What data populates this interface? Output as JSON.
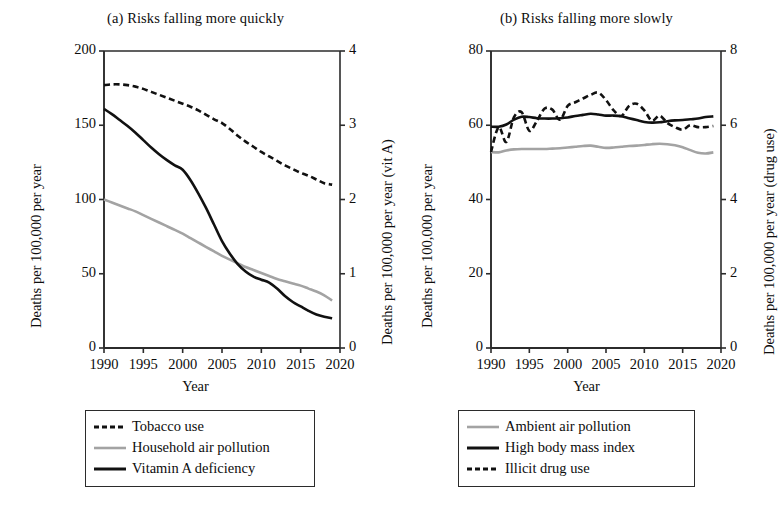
{
  "figure": {
    "width": 782,
    "height": 518,
    "background": "#ffffff"
  },
  "colors": {
    "black": "#111111",
    "gray": "#a3a3a3",
    "axis": "#2b2b2b"
  },
  "chart_data": [
    {
      "id": "panel-a",
      "type": "line",
      "title": "(a) Risks falling more quickly",
      "xlabel": "Year",
      "ylabel": "Deaths per 100,000 per year",
      "y2label": "Deaths per 100,000 per year (vit A)",
      "xlim": [
        1990,
        2020
      ],
      "ylim": [
        0,
        200
      ],
      "y2lim": [
        0,
        4
      ],
      "xticks": [
        1990,
        1995,
        2000,
        2005,
        2010,
        2015,
        2020
      ],
      "xticklabels": [
        "1990",
        "1995",
        "2000",
        "2005",
        "2010",
        "2015",
        "2020"
      ],
      "yticks": [
        0,
        50,
        100,
        150,
        200
      ],
      "yticklabels": [
        "0",
        "50",
        "100",
        "150",
        "200"
      ],
      "y2ticks": [
        0,
        1,
        2,
        3,
        4
      ],
      "y2ticklabels": [
        "0",
        "1",
        "2",
        "3",
        "4"
      ],
      "grid": false,
      "legend_position": "below",
      "series": [
        {
          "name": "Tobacco use",
          "style": "dashed",
          "color": "#111111",
          "axis": "left",
          "x": [
            1990,
            1991,
            1992,
            1993,
            1994,
            1995,
            1996,
            1997,
            1998,
            1999,
            2000,
            2001,
            2002,
            2003,
            2004,
            2005,
            2006,
            2007,
            2008,
            2009,
            2010,
            2011,
            2012,
            2013,
            2014,
            2015,
            2016,
            2017,
            2018,
            2019
          ],
          "values": [
            177,
            177.5,
            177.5,
            177,
            176,
            174.5,
            172.5,
            170.5,
            168.5,
            166.5,
            164.5,
            162.5,
            160,
            157,
            154,
            151.5,
            147.5,
            143,
            139,
            135.5,
            132,
            129,
            126,
            123,
            120.5,
            118,
            116,
            113.5,
            111,
            110
          ]
        },
        {
          "name": "Household air pollution",
          "style": "solid",
          "color": "#a3a3a3",
          "axis": "left",
          "x": [
            1990,
            1991,
            1992,
            1993,
            1994,
            1995,
            1996,
            1997,
            1998,
            1999,
            2000,
            2001,
            2002,
            2003,
            2004,
            2005,
            2006,
            2007,
            2008,
            2009,
            2010,
            2011,
            2012,
            2013,
            2014,
            2015,
            2016,
            2017,
            2018,
            2019
          ],
          "values": [
            100,
            98,
            96,
            94,
            92,
            89.5,
            87,
            84.5,
            82,
            79.5,
            77,
            74,
            71,
            68,
            65,
            62,
            59.5,
            57,
            54.5,
            52.5,
            50.5,
            48.5,
            46.5,
            45,
            43.5,
            42,
            40,
            38,
            35.5,
            32
          ]
        },
        {
          "name": "Vitamin A deficiency",
          "style": "solid",
          "color": "#111111",
          "axis": "right",
          "x": [
            1990,
            1991,
            1992,
            1993,
            1994,
            1995,
            1996,
            1997,
            1998,
            1999,
            2000,
            2001,
            2002,
            2003,
            2004,
            2005,
            2006,
            2007,
            2008,
            2009,
            2010,
            2011,
            2012,
            2013,
            2014,
            2015,
            2016,
            2017,
            2018,
            2019
          ],
          "values": [
            3.22,
            3.15,
            3.07,
            2.99,
            2.9,
            2.8,
            2.7,
            2.61,
            2.53,
            2.46,
            2.4,
            2.26,
            2.08,
            1.88,
            1.66,
            1.44,
            1.27,
            1.13,
            1.03,
            0.96,
            0.92,
            0.88,
            0.8,
            0.7,
            0.62,
            0.56,
            0.5,
            0.45,
            0.42,
            0.4
          ]
        }
      ],
      "legend": [
        {
          "label": "Tobacco use",
          "style": "dashed",
          "color": "#111111"
        },
        {
          "label": "Household air pollution",
          "style": "solid",
          "color": "#a3a3a3"
        },
        {
          "label": "Vitamin A deficiency",
          "style": "solid",
          "color": "#111111"
        }
      ]
    },
    {
      "id": "panel-b",
      "type": "line",
      "title": "(b) Risks falling more slowly",
      "xlabel": "Year",
      "ylabel": "Deaths per 100,000 per year",
      "y2label": "Deaths per 100,000 per year (drug use)",
      "xlim": [
        1990,
        2020
      ],
      "ylim": [
        0,
        80
      ],
      "y2lim": [
        0,
        8
      ],
      "xticks": [
        1990,
        1995,
        2000,
        2005,
        2010,
        2015,
        2020
      ],
      "xticklabels": [
        "1990",
        "1995",
        "2000",
        "2005",
        "2010",
        "2015",
        "2020"
      ],
      "yticks": [
        0,
        20,
        40,
        60,
        80
      ],
      "yticklabels": [
        "0",
        "20",
        "40",
        "60",
        "80"
      ],
      "y2ticks": [
        0,
        2,
        4,
        6,
        8
      ],
      "y2ticklabels": [
        "0",
        "2",
        "4",
        "6",
        "8"
      ],
      "grid": false,
      "legend_position": "below",
      "series": [
        {
          "name": "Ambient air pollution",
          "style": "solid",
          "color": "#a3a3a3",
          "axis": "left",
          "x": [
            1990,
            1991,
            1992,
            1993,
            1994,
            1995,
            1996,
            1997,
            1998,
            1999,
            2000,
            2001,
            2002,
            2003,
            2004,
            2005,
            2006,
            2007,
            2008,
            2009,
            2010,
            2011,
            2012,
            2013,
            2014,
            2015,
            2016,
            2017,
            2018,
            2019
          ],
          "values": [
            52.8,
            52.7,
            53.2,
            53.5,
            53.6,
            53.6,
            53.6,
            53.6,
            53.7,
            53.8,
            54.0,
            54.2,
            54.4,
            54.5,
            54.2,
            53.9,
            54.0,
            54.2,
            54.4,
            54.5,
            54.7,
            54.9,
            55.0,
            54.9,
            54.6,
            54.1,
            53.3,
            52.6,
            52.4,
            52.7
          ]
        },
        {
          "name": "High body mass index",
          "style": "solid",
          "color": "#111111",
          "axis": "left",
          "x": [
            1990,
            1991,
            1992,
            1993,
            1994,
            1995,
            1996,
            1997,
            1998,
            1999,
            2000,
            2001,
            2002,
            2003,
            2004,
            2005,
            2006,
            2007,
            2008,
            2009,
            2010,
            2011,
            2012,
            2013,
            2014,
            2015,
            2016,
            2017,
            2018,
            2019
          ],
          "values": [
            59.6,
            59.6,
            60.2,
            61.5,
            62.3,
            62.2,
            61.9,
            61.8,
            61.8,
            61.9,
            62.1,
            62.5,
            62.8,
            63.1,
            62.9,
            62.6,
            62.6,
            62.4,
            61.9,
            61.4,
            60.9,
            60.7,
            60.8,
            61.1,
            61.3,
            61.4,
            61.6,
            61.8,
            62.2,
            62.4
          ]
        },
        {
          "name": "Illicit drug use",
          "style": "dashed",
          "color": "#111111",
          "axis": "right",
          "x": [
            1990,
            1991,
            1992,
            1993,
            1994,
            1995,
            1996,
            1997,
            1998,
            1999,
            2000,
            2001,
            2002,
            2003,
            2004,
            2005,
            2006,
            2007,
            2008,
            2009,
            2010,
            2011,
            2012,
            2013,
            2014,
            2015,
            2016,
            2017,
            2018,
            2019
          ],
          "values": [
            5.28,
            5.95,
            5.55,
            6.22,
            6.35,
            5.85,
            6.12,
            6.45,
            6.42,
            6.15,
            6.52,
            6.62,
            6.72,
            6.82,
            6.88,
            6.68,
            6.4,
            6.25,
            6.52,
            6.58,
            6.4,
            6.12,
            6.26,
            6.06,
            5.95,
            5.88,
            6.0,
            5.95,
            5.95,
            5.98
          ]
        }
      ],
      "legend": [
        {
          "label": "Ambient air pollution",
          "style": "solid",
          "color": "#a3a3a3"
        },
        {
          "label": "High body mass index",
          "style": "solid",
          "color": "#111111"
        },
        {
          "label": "Illicit drug use",
          "style": "dashed",
          "color": "#111111"
        }
      ]
    }
  ]
}
